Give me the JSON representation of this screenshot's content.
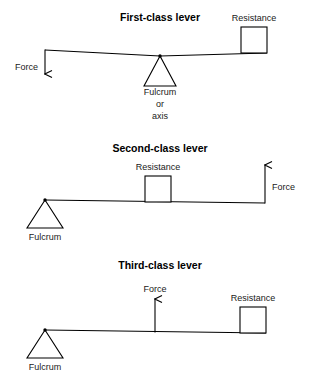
{
  "figure": {
    "background_color": "#ffffff",
    "line_color": "#000000"
  },
  "levers": {
    "first": {
      "title": "First-class lever",
      "force_label": "Force",
      "resistance_label": "Resistance",
      "fulcrum_label_line1": "Fulcrum",
      "fulcrum_label_line2": "or",
      "fulcrum_label_line3": "axis",
      "force_direction": "down",
      "force_position": "left-end",
      "fulcrum_position": "center",
      "resistance_position": "right-end"
    },
    "second": {
      "title": "Second-class lever",
      "force_label": "Force",
      "resistance_label": "Resistance",
      "fulcrum_label": "Fulcrum",
      "force_direction": "up",
      "force_position": "right-end",
      "fulcrum_position": "left-end",
      "resistance_position": "center-left"
    },
    "third": {
      "title": "Third-class lever",
      "force_label": "Force",
      "resistance_label": "Resistance",
      "fulcrum_label": "Fulcrum",
      "force_direction": "up",
      "force_position": "center",
      "fulcrum_position": "left-end",
      "resistance_position": "right-end"
    }
  }
}
